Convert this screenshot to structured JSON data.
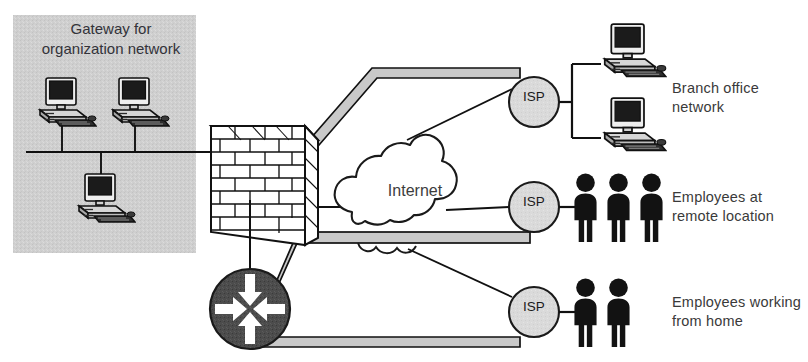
{
  "diagram": {
    "type": "network-topology"
  },
  "gateway_zone": {
    "caption": "Gateway for\norganization network",
    "background_color": "#cfcfcf",
    "bounds": {
      "x": 13,
      "y": 15,
      "width": 183,
      "height": 238
    },
    "workstations": [
      {
        "name": "workstation-1",
        "x": 40,
        "y": 78
      },
      {
        "name": "workstation-2",
        "x": 113,
        "y": 78
      },
      {
        "name": "workstation-3",
        "x": 80,
        "y": 168
      }
    ],
    "bus_line_y": 152
  },
  "firewall": {
    "name": "firewall-brick-wall",
    "icon": "brick-wall-icon",
    "fill": "#ffffff",
    "stroke": "#111111"
  },
  "router": {
    "name": "router-icon",
    "icon": "router-four-arrows-icon",
    "fill": "#4a4a4a",
    "arrow_color": "#ffffff",
    "arrow_count": 4,
    "cx": 250,
    "cy": 309,
    "r": 40
  },
  "cloud": {
    "name": "internet-cloud",
    "label": "Internet",
    "fill": "#ffffff",
    "stroke": "#1a1a1a"
  },
  "isps": [
    {
      "name": "isp-top",
      "label": "ISP",
      "cx": 534,
      "cy": 102,
      "r": 25
    },
    {
      "name": "isp-middle",
      "label": "ISP",
      "cx": 534,
      "cy": 207,
      "r": 25
    },
    {
      "name": "isp-bottom",
      "label": "ISP",
      "cx": 534,
      "cy": 312,
      "r": 25
    }
  ],
  "endpoints": [
    {
      "name": "branch-office-network",
      "label": "Branch office\nnetwork",
      "icon": "computer-icon",
      "count": 2
    },
    {
      "name": "employees-remote-location",
      "label": "Employees at\nremote location",
      "icon": "person-icon",
      "count": 3
    },
    {
      "name": "employees-working-from-home",
      "label": "Employees working\nfrom home",
      "icon": "person-icon",
      "count": 2
    }
  ],
  "colors": {
    "line": "#1a1a1a",
    "pipe_fill": "#c8c8c8",
    "isp_fill": "#d9d9d9",
    "zone_gray": "#cfcfcf",
    "figure_black": "#111111",
    "text": "#3a3a3a"
  }
}
